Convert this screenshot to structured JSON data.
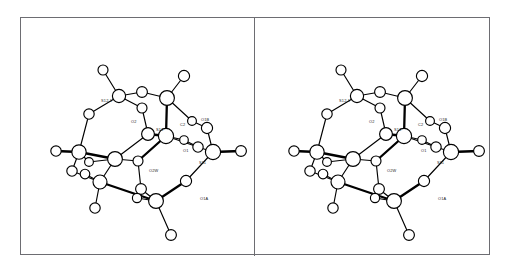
{
  "figure": {
    "kind": "stereo-pair-molecular-structure",
    "panel_count": 2,
    "frame_color": "#6d6d72",
    "line_color": "#000000",
    "background_color": "#ffffff"
  },
  "panels": [
    {
      "id": "left",
      "name": "stereo-view-left"
    },
    {
      "id": "right",
      "name": "stereo-view-right"
    }
  ],
  "labels": [
    {
      "key": "s12p",
      "text": "S12.1",
      "x": 48,
      "y": 54
    },
    {
      "key": "o2",
      "text": "O2",
      "x": 78,
      "y": 75
    },
    {
      "key": "s12",
      "text": "S12",
      "x": 103,
      "y": 83
    },
    {
      "key": "c2",
      "text": "C2",
      "x": 127,
      "y": 78
    },
    {
      "key": "o1b",
      "text": "O1B",
      "x": 148,
      "y": 73
    },
    {
      "key": "o1",
      "text": "O1",
      "x": 130,
      "y": 104
    },
    {
      "key": "s11",
      "text": "S11",
      "x": 146,
      "y": 116
    },
    {
      "key": "cl",
      "text": "Cl",
      "x": 203,
      "y": 102
    },
    {
      "key": "o2w",
      "text": "O2W",
      "x": 96,
      "y": 124
    },
    {
      "key": "o1a",
      "text": "O1A",
      "x": 147,
      "y": 152
    }
  ],
  "atoms": [
    {
      "id": "a01",
      "x": 50,
      "y": 22,
      "r": 5.0,
      "kind": "terminal"
    },
    {
      "id": "a02",
      "x": 66,
      "y": 48,
      "r": 6.6,
      "kind": "node"
    },
    {
      "id": "a03",
      "x": 89,
      "y": 44,
      "r": 5.4,
      "kind": "node"
    },
    {
      "id": "a04",
      "x": 114,
      "y": 50,
      "r": 7.4,
      "kind": "node"
    },
    {
      "id": "a05",
      "x": 131,
      "y": 28,
      "r": 5.6,
      "kind": "terminal"
    },
    {
      "id": "a06",
      "x": 89,
      "y": 60,
      "r": 5.0,
      "kind": "node"
    },
    {
      "id": "a07",
      "x": 36,
      "y": 66,
      "r": 5.2,
      "kind": "node"
    },
    {
      "id": "a08",
      "x": 113,
      "y": 88,
      "r": 7.6,
      "kind": "node"
    },
    {
      "id": "a09",
      "x": 95,
      "y": 86,
      "r": 6.4,
      "kind": "node"
    },
    {
      "id": "a10",
      "x": 139,
      "y": 73,
      "r": 4.4,
      "kind": "node"
    },
    {
      "id": "a11",
      "x": 154,
      "y": 80,
      "r": 5.6,
      "kind": "node"
    },
    {
      "id": "a12",
      "x": 131,
      "y": 92,
      "r": 4.3,
      "kind": "node"
    },
    {
      "id": "a13",
      "x": 145,
      "y": 99,
      "r": 5.2,
      "kind": "node"
    },
    {
      "id": "a14",
      "x": 160,
      "y": 104,
      "r": 7.6,
      "kind": "node"
    },
    {
      "id": "a15",
      "x": 188,
      "y": 103,
      "r": 5.4,
      "kind": "terminal"
    },
    {
      "id": "a16",
      "x": 26,
      "y": 104,
      "r": 7.2,
      "kind": "node"
    },
    {
      "id": "a17",
      "x": 3,
      "y": 103,
      "r": 5.2,
      "kind": "terminal"
    },
    {
      "id": "a18",
      "x": 36,
      "y": 114,
      "r": 4.4,
      "kind": "node"
    },
    {
      "id": "a19",
      "x": 19,
      "y": 123,
      "r": 5.2,
      "kind": "node"
    },
    {
      "id": "a20",
      "x": 62,
      "y": 111,
      "r": 7.4,
      "kind": "node"
    },
    {
      "id": "a21",
      "x": 85,
      "y": 113,
      "r": 5.0,
      "kind": "node"
    },
    {
      "id": "a22",
      "x": 47,
      "y": 134,
      "r": 7.0,
      "kind": "node"
    },
    {
      "id": "a23",
      "x": 32,
      "y": 126,
      "r": 4.8,
      "kind": "node"
    },
    {
      "id": "a24",
      "x": 88,
      "y": 141,
      "r": 5.4,
      "kind": "node"
    },
    {
      "id": "a25",
      "x": 133,
      "y": 133,
      "r": 5.6,
      "kind": "node"
    },
    {
      "id": "a26",
      "x": 103,
      "y": 153,
      "r": 7.4,
      "kind": "node"
    },
    {
      "id": "a27",
      "x": 84,
      "y": 150,
      "r": 4.6,
      "kind": "node"
    },
    {
      "id": "a28",
      "x": 42,
      "y": 160,
      "r": 5.2,
      "kind": "terminal"
    },
    {
      "id": "a29",
      "x": 118,
      "y": 187,
      "r": 5.4,
      "kind": "terminal"
    }
  ],
  "bonds": [
    {
      "a": "a01",
      "b": "a02",
      "w": "thin"
    },
    {
      "a": "a02",
      "b": "a03",
      "w": "thin"
    },
    {
      "a": "a02",
      "b": "a06",
      "w": "thin"
    },
    {
      "a": "a02",
      "b": "a07",
      "w": "thin"
    },
    {
      "a": "a03",
      "b": "a04",
      "w": "thin"
    },
    {
      "a": "a04",
      "b": "a05",
      "w": "thin"
    },
    {
      "a": "a04",
      "b": "a08",
      "w": "thick"
    },
    {
      "a": "a04",
      "b": "a10",
      "w": "thin"
    },
    {
      "a": "a06",
      "b": "a09",
      "w": "thin"
    },
    {
      "a": "a07",
      "b": "a16",
      "w": "thin"
    },
    {
      "a": "a08",
      "b": "a09",
      "w": "thick"
    },
    {
      "a": "a08",
      "b": "a12",
      "w": "thin"
    },
    {
      "a": "a08",
      "b": "a13",
      "w": "thin"
    },
    {
      "a": "a08",
      "b": "a21",
      "w": "thick"
    },
    {
      "a": "a09",
      "b": "a20",
      "w": "thin"
    },
    {
      "a": "a10",
      "b": "a11",
      "w": "thin"
    },
    {
      "a": "a11",
      "b": "a14",
      "w": "thin"
    },
    {
      "a": "a12",
      "b": "a13",
      "w": "thin"
    },
    {
      "a": "a13",
      "b": "a14",
      "w": "thin"
    },
    {
      "a": "a14",
      "b": "a15",
      "w": "thick"
    },
    {
      "a": "a14",
      "b": "a25",
      "w": "thin"
    },
    {
      "a": "a16",
      "b": "a17",
      "w": "thick"
    },
    {
      "a": "a16",
      "b": "a18",
      "w": "thin"
    },
    {
      "a": "a16",
      "b": "a19",
      "w": "thin"
    },
    {
      "a": "a16",
      "b": "a20",
      "w": "thick"
    },
    {
      "a": "a18",
      "b": "a20",
      "w": "thin"
    },
    {
      "a": "a19",
      "b": "a22",
      "w": "thin"
    },
    {
      "a": "a20",
      "b": "a21",
      "w": "thin"
    },
    {
      "a": "a20",
      "b": "a22",
      "w": "thin"
    },
    {
      "a": "a22",
      "b": "a23",
      "w": "thin"
    },
    {
      "a": "a22",
      "b": "a26",
      "w": "thick"
    },
    {
      "a": "a22",
      "b": "a28",
      "w": "thin"
    },
    {
      "a": "a21",
      "b": "a24",
      "w": "thin"
    },
    {
      "a": "a24",
      "b": "a26",
      "w": "thin"
    },
    {
      "a": "a24",
      "b": "a27",
      "w": "thin"
    },
    {
      "a": "a25",
      "b": "a26",
      "w": "thick"
    },
    {
      "a": "a26",
      "b": "a27",
      "w": "thin"
    },
    {
      "a": "a26",
      "b": "a29",
      "w": "thin"
    }
  ]
}
